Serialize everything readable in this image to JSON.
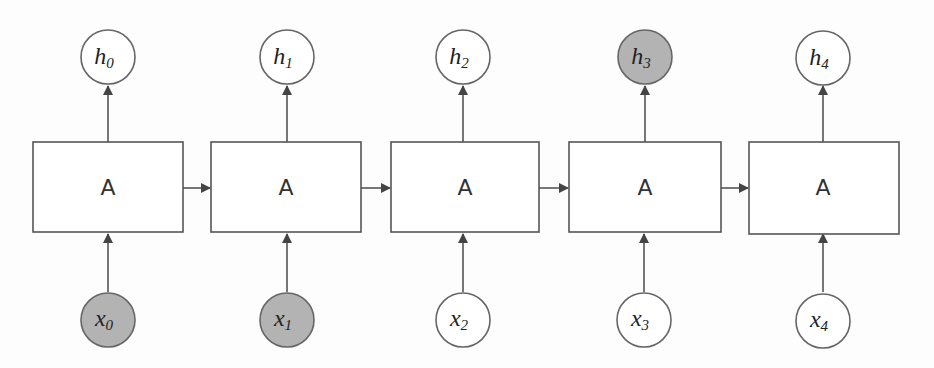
{
  "diagram": {
    "type": "unrolled-rnn",
    "colors": {
      "highlight_fill": "#b3b3b3",
      "normal_fill": "#ffffff",
      "stroke": "#555555"
    },
    "cells": [
      {
        "label": "A",
        "input": {
          "base": "x",
          "sub": "0",
          "highlighted": true
        },
        "output": {
          "base": "h",
          "sub": "0",
          "highlighted": false
        }
      },
      {
        "label": "A",
        "input": {
          "base": "x",
          "sub": "1",
          "highlighted": true
        },
        "output": {
          "base": "h",
          "sub": "1",
          "highlighted": false
        }
      },
      {
        "label": "A",
        "input": {
          "base": "x",
          "sub": "2",
          "highlighted": false
        },
        "output": {
          "base": "h",
          "sub": "2",
          "highlighted": false
        }
      },
      {
        "label": "A",
        "input": {
          "base": "x",
          "sub": "3",
          "highlighted": false
        },
        "output": {
          "base": "h",
          "sub": "3",
          "highlighted": true
        }
      },
      {
        "label": "A",
        "input": {
          "base": "x",
          "sub": "4",
          "highlighted": false
        },
        "output": {
          "base": "h",
          "sub": "4",
          "highlighted": false
        }
      }
    ]
  }
}
